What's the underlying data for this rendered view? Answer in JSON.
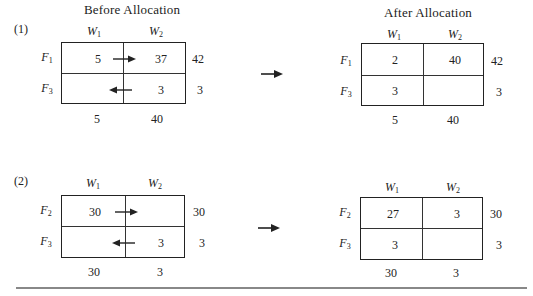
{
  "headings": {
    "before": "Before Allocation",
    "after": "After Allocation"
  },
  "problems": [
    {
      "label": "(1)",
      "columns": [
        "W",
        "W"
      ],
      "column_subs": [
        "1",
        "2"
      ],
      "before": {
        "rows": [
          {
            "name": "F",
            "sub": "1",
            "cells": [
              "5",
              "37"
            ],
            "supply": "42"
          },
          {
            "name": "F",
            "sub": "3",
            "cells": [
              "",
              "3"
            ],
            "supply": "3"
          }
        ],
        "demand": [
          "5",
          "40"
        ],
        "arrows": [
          {
            "row": 1,
            "direction": "right"
          },
          {
            "row": 2,
            "direction": "left"
          }
        ]
      },
      "after": {
        "rows": [
          {
            "name": "F",
            "sub": "1",
            "cells": [
              "2",
              "40"
            ],
            "supply": "42"
          },
          {
            "name": "F",
            "sub": "3",
            "cells": [
              "3",
              ""
            ],
            "supply": "3"
          }
        ],
        "demand": [
          "5",
          "40"
        ]
      }
    },
    {
      "label": "(2)",
      "columns": [
        "W",
        "W"
      ],
      "column_subs": [
        "1",
        "2"
      ],
      "before": {
        "rows": [
          {
            "name": "F",
            "sub": "2",
            "cells": [
              "30",
              ""
            ],
            "supply": "30"
          },
          {
            "name": "F",
            "sub": "3",
            "cells": [
              "",
              "3"
            ],
            "supply": "3"
          }
        ],
        "demand": [
          "30",
          "3"
        ],
        "arrows": [
          {
            "row": 1,
            "direction": "right"
          },
          {
            "row": 2,
            "direction": "left"
          }
        ]
      },
      "after": {
        "rows": [
          {
            "name": "F",
            "sub": "2",
            "cells": [
              "27",
              "3"
            ],
            "supply": "30"
          },
          {
            "name": "F",
            "sub": "3",
            "cells": [
              "3",
              ""
            ],
            "supply": "3"
          }
        ],
        "demand": [
          "30",
          "3"
        ]
      }
    }
  ],
  "icons": {
    "transition_arrow": "right-arrow",
    "shift_arrow": "small-arrow"
  }
}
